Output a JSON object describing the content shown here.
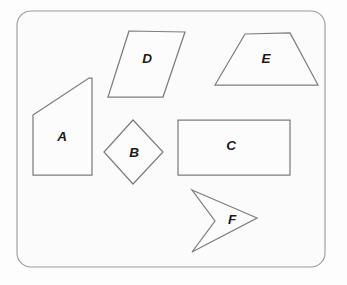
{
  "canvas": {
    "width": 347,
    "height": 285,
    "background_color": "#fdfdfd",
    "paper_color": "#fbfbfb"
  },
  "frame": {
    "name": "rounded-border-frame",
    "x": 17,
    "y": 11,
    "width": 308,
    "height": 256,
    "corner_radius": 14,
    "stroke_color": "#9a9a9a"
  },
  "style": {
    "shape_stroke_color": "#7d7d7d",
    "shape_fill_color": "#fcfcfc",
    "label_color": "#1a1a1a"
  },
  "shapes": [
    {
      "label": "A",
      "kind": "quadrilateral",
      "points": "33,115 89,78 92,78 92,175 33,175",
      "label_x": 62,
      "label_y": 137
    },
    {
      "label": "B",
      "kind": "rhombus",
      "points": "133,120 163,152 133,184 104,152",
      "label_x": 134,
      "label_y": 153
    },
    {
      "label": "C",
      "kind": "rectangle",
      "points": "178,120 290,120 290,175 178,175",
      "label_x": 231,
      "label_y": 146
    },
    {
      "label": "D",
      "kind": "parallelogram",
      "points": "129,31 185,32 163,97 108,97",
      "label_x": 147,
      "label_y": 59
    },
    {
      "label": "E",
      "kind": "trapezoid",
      "points": "245,34 290,33 318,85 215,85",
      "label_x": 266,
      "label_y": 59
    },
    {
      "label": "F",
      "kind": "concave-arrow",
      "points": "192,190 257,218 192,252 215,221",
      "label_x": 232,
      "label_y": 220
    }
  ]
}
